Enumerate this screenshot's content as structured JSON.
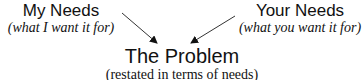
{
  "left": {
    "title": "My Needs",
    "subtitle": "(what I want it for)"
  },
  "right": {
    "title": "Your Needs",
    "subtitle": "(what you want it for)"
  },
  "center": {
    "title": "The Problem",
    "subtitle": "(restated in terms of needs)"
  },
  "arrows": [
    {
      "from": "My Needs",
      "to": "The Problem"
    },
    {
      "from": "Your Needs",
      "to": "The Problem"
    }
  ]
}
